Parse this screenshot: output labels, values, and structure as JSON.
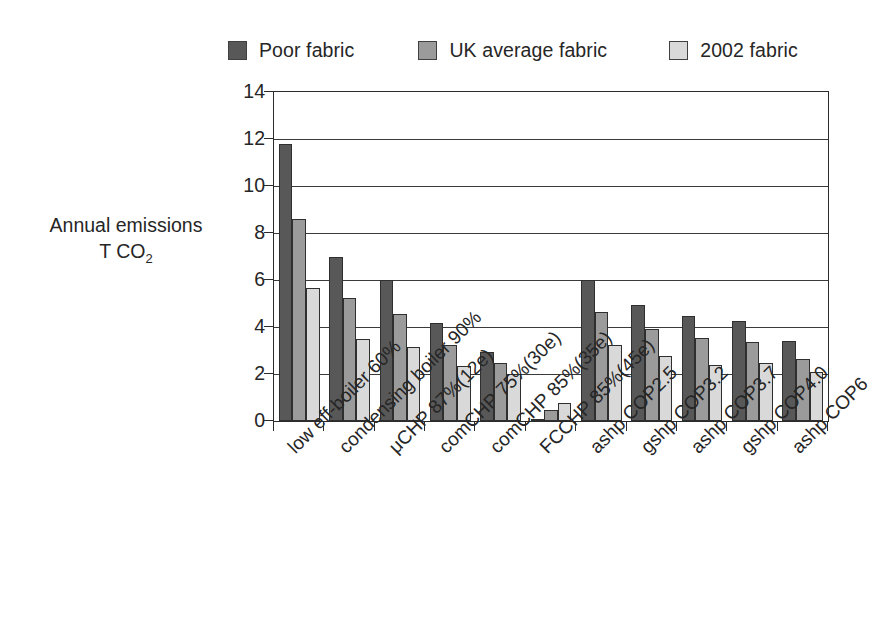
{
  "chart_data": {
    "type": "bar",
    "title": "",
    "xlabel": "",
    "ylabel": "Annual emissions T CO2",
    "ylabel_line1": "Annual emissions",
    "ylabel_line2_prefix": "T CO",
    "ylabel_line2_sub": "2",
    "ylim": [
      0,
      14
    ],
    "yticks": [
      0,
      2,
      4,
      6,
      8,
      10,
      12,
      14
    ],
    "grid": true,
    "grid_axis": "y",
    "legend_position": "top",
    "categories": [
      "low eff-boiler 60%",
      "condensing boiler 90%",
      "μCHP 87%(12e)",
      "comCHP 75%(30e)",
      "comCHP 85%(35e)",
      "FCCHP 85%(45e)",
      "ashp COP2.5",
      "gshp COP3.2",
      "ashp COP3.7",
      "gshp COP4.0",
      "ashp COP6"
    ],
    "series": [
      {
        "name": "Poor fabric",
        "color": "#585858",
        "values": [
          11.8,
          7.0,
          6.0,
          4.15,
          2.95,
          0.05,
          6.0,
          4.95,
          4.45,
          4.25,
          3.4
        ]
      },
      {
        "name": "UK average fabric",
        "color": "#9b9b9b",
        "values": [
          8.6,
          5.25,
          4.55,
          3.25,
          2.45,
          0.45,
          4.65,
          3.9,
          3.55,
          3.35,
          2.65
        ]
      },
      {
        "name": "2002 fabric",
        "color": "#d9d9d9",
        "values": [
          5.65,
          3.5,
          3.15,
          2.35,
          2.0,
          0.75,
          3.25,
          2.75,
          2.4,
          2.45,
          2.1
        ]
      }
    ]
  },
  "legend": {
    "items": [
      {
        "label": "Poor fabric",
        "color": "#585858"
      },
      {
        "label": "UK average fabric",
        "color": "#9b9b9b"
      },
      {
        "label": "2002 fabric",
        "color": "#d9d9d9"
      }
    ]
  },
  "axes": {
    "y_tick_labels": [
      "0",
      "2",
      "4",
      "6",
      "8",
      "10",
      "12",
      "14"
    ]
  }
}
